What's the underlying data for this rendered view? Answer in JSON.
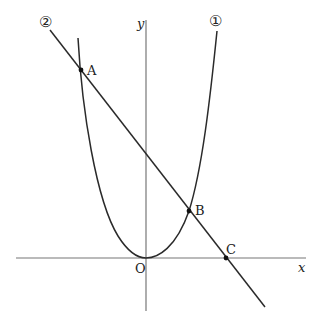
{
  "figure": {
    "axes": {
      "x_label": "x",
      "y_label": "y",
      "origin_label": "O"
    },
    "curves": [
      {
        "id": "1",
        "label": "①",
        "type": "parabola",
        "vertex": "O"
      },
      {
        "id": "2",
        "label": "②",
        "type": "line"
      }
    ],
    "points": [
      {
        "name": "A",
        "label": "A",
        "on": [
          "1",
          "2"
        ]
      },
      {
        "name": "B",
        "label": "B",
        "on": [
          "1",
          "2"
        ]
      },
      {
        "name": "C",
        "label": "C",
        "on": [
          "2",
          "x-axis"
        ]
      },
      {
        "name": "O",
        "label": "O",
        "on": [
          "origin"
        ]
      }
    ],
    "colors": {
      "axis": "#777777",
      "curve": "#2a2a2a",
      "point": "#111111"
    }
  }
}
